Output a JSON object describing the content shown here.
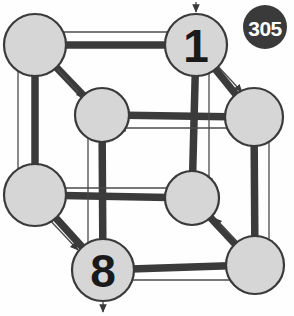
{
  "figure": {
    "title": "305",
    "type": "directed-cube-graph",
    "badge": {
      "label": "305",
      "fill_color": "#3a3a3a",
      "text_color": "#ffffff",
      "cx": 265,
      "cy": 27,
      "r": 22
    },
    "style": {
      "node_fill": "#d6d6d6",
      "node_stroke": "#3a3a3a",
      "edge_color": "#3b3b3b",
      "arrow_color": "#4a4a4a",
      "background": "#fefefe"
    },
    "nodes": [
      {
        "id": "n0",
        "label": "",
        "cx": 35,
        "cy": 45,
        "r": 31
      },
      {
        "id": "n1",
        "label": "1",
        "cx": 196,
        "cy": 45,
        "r": 31
      },
      {
        "id": "n2",
        "label": "",
        "cx": 102,
        "cy": 115,
        "r": 27
      },
      {
        "id": "n3",
        "label": "",
        "cx": 254,
        "cy": 117,
        "r": 29
      },
      {
        "id": "n4",
        "label": "",
        "cx": 35,
        "cy": 195,
        "r": 31
      },
      {
        "id": "n5",
        "label": "",
        "cx": 192,
        "cy": 198,
        "r": 27
      },
      {
        "id": "n6",
        "label": "8",
        "cx": 103,
        "cy": 270,
        "r": 31
      },
      {
        "id": "n7",
        "label": "",
        "cx": 255,
        "cy": 265,
        "r": 29
      }
    ],
    "edges": [
      {
        "id": "e0",
        "from": "n1",
        "to": "n0",
        "x1": 196,
        "y1": 45,
        "x2": 35,
        "y2": 45,
        "kind": "horizontal-top-back"
      },
      {
        "id": "e1",
        "from": "n0",
        "to": "n2",
        "x1": 35,
        "y1": 45,
        "x2": 102,
        "y2": 115,
        "kind": "diagonal-top-left"
      },
      {
        "id": "e2",
        "from": "n1",
        "to": "n3",
        "x1": 196,
        "y1": 45,
        "x2": 254,
        "y2": 117,
        "kind": "diagonal-top-right"
      },
      {
        "id": "e3",
        "from": "n3",
        "to": "n2",
        "x1": 254,
        "y1": 117,
        "x2": 102,
        "y2": 115,
        "kind": "horizontal-top-front"
      },
      {
        "id": "e4",
        "from": "n4",
        "to": "n0",
        "x1": 35,
        "y1": 195,
        "x2": 35,
        "y2": 45,
        "kind": "vertical-left-back"
      },
      {
        "id": "e5",
        "from": "n1",
        "to": "n5",
        "x1": 196,
        "y1": 45,
        "x2": 192,
        "y2": 198,
        "kind": "vertical-right-back"
      },
      {
        "id": "e6",
        "from": "n2",
        "to": "n6",
        "x1": 102,
        "y1": 115,
        "x2": 103,
        "y2": 270,
        "kind": "vertical-center-front"
      },
      {
        "id": "e7",
        "from": "n3",
        "to": "n7",
        "x1": 254,
        "y1": 117,
        "x2": 255,
        "y2": 265,
        "kind": "vertical-right-front"
      },
      {
        "id": "e8",
        "from": "n5",
        "to": "n4",
        "x1": 192,
        "y1": 198,
        "x2": 35,
        "y2": 195,
        "kind": "horizontal-mid"
      },
      {
        "id": "e9",
        "from": "n4",
        "to": "n6",
        "x1": 35,
        "y1": 195,
        "x2": 103,
        "y2": 270,
        "kind": "diagonal-bottom-left"
      },
      {
        "id": "e10",
        "from": "n7",
        "to": "n5",
        "x1": 255,
        "y1": 265,
        "x2": 192,
        "y2": 198,
        "kind": "diagonal-bottom-right"
      },
      {
        "id": "e11",
        "from": "n7",
        "to": "n6",
        "x1": 255,
        "y1": 265,
        "x2": 103,
        "y2": 270,
        "kind": "horizontal-bottom"
      }
    ],
    "arrows": [
      {
        "id": "a0",
        "x1": 188,
        "y1": 32,
        "x2": 48,
        "y2": 32,
        "desc": "top-back-left"
      },
      {
        "id": "a1",
        "x1": 55,
        "y1": 67,
        "x2": 84,
        "y2": 98,
        "desc": "diag-top-left-down"
      },
      {
        "id": "a2",
        "x1": 214,
        "y1": 62,
        "x2": 242,
        "y2": 92,
        "desc": "diag-top-right-down"
      },
      {
        "id": "a3",
        "x1": 240,
        "y1": 128,
        "x2": 118,
        "y2": 128,
        "desc": "top-front-left"
      },
      {
        "id": "a4",
        "x1": 18,
        "y1": 180,
        "x2": 18,
        "y2": 58,
        "desc": "left-back-up"
      },
      {
        "id": "a5",
        "x1": 209,
        "y1": 62,
        "x2": 209,
        "y2": 186,
        "desc": "right-back-down"
      },
      {
        "id": "a6",
        "x1": 88,
        "y1": 134,
        "x2": 88,
        "y2": 252,
        "desc": "center-front-down"
      },
      {
        "id": "a7",
        "x1": 269,
        "y1": 136,
        "x2": 269,
        "y2": 248,
        "desc": "right-front-down"
      },
      {
        "id": "a8",
        "x1": 180,
        "y1": 188,
        "x2": 52,
        "y2": 188,
        "desc": "mid-left"
      },
      {
        "id": "a9",
        "x1": 46,
        "y1": 216,
        "x2": 78,
        "y2": 250,
        "desc": "diag-bottom-left-down"
      },
      {
        "id": "a10",
        "x1": 243,
        "y1": 248,
        "x2": 214,
        "y2": 218,
        "desc": "diag-bottom-right-up"
      },
      {
        "id": "a11",
        "x1": 238,
        "y1": 280,
        "x2": 124,
        "y2": 280,
        "desc": "bottom-left"
      },
      {
        "id": "a12",
        "x1": 196,
        "y1": 2,
        "x2": 196,
        "y2": 12,
        "desc": "external-in-top"
      },
      {
        "id": "a13",
        "x1": 103,
        "y1": 302,
        "x2": 103,
        "y2": 312,
        "desc": "external-out-bottom"
      }
    ]
  }
}
